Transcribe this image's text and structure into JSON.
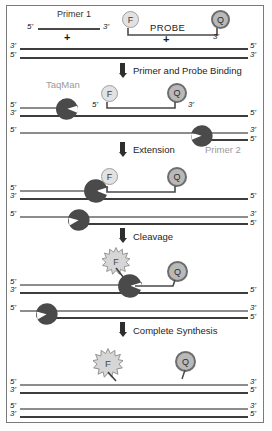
{
  "figure": {
    "colors": {
      "frame_border": "#7a7a7a",
      "strand_dark": "#3d3d3d",
      "strand_light": "#8d8d8d",
      "polymerase_fill": "#4a4a4a",
      "fluorophore_fill": "#e2e2e2",
      "quencher_fill": "#b9b9b9",
      "label_gray": "#9a9a9a",
      "arrow": "#2e2e2e"
    }
  },
  "reagents": {
    "primer1_label": "Primer 1",
    "primer1_five": "5'",
    "primer1_three": "3'",
    "plus1": "+",
    "plus2": "+",
    "probe_label": "PROBE",
    "probe_three": "3'",
    "fluorophore_letter": "F",
    "quencher_letter": "Q"
  },
  "steps": [
    {
      "id": "step-binding",
      "label": "Primer and Probe Binding"
    },
    {
      "id": "step-extension",
      "label": "Extension"
    },
    {
      "id": "step-cleavage",
      "label": "Cleavage"
    },
    {
      "id": "step-complete",
      "label": "Complete Synthesis"
    }
  ],
  "enzymes": {
    "taqman_label": "TaqMan",
    "primer2_label": "Primer 2"
  },
  "panels": {
    "template": {
      "name": "Double-stranded template DNA",
      "top_left": "3'",
      "top_right": "5'",
      "bottom_left": "5'",
      "bottom_right": "3'"
    },
    "binding": {
      "name": "Primer and probe annealed to template",
      "top_left": "5'",
      "template_left": "3'",
      "template_right": "5'",
      "lower_left": "5'",
      "lower_right_top": "3'",
      "lower_right_bottom": "5'",
      "probe_five": "5'",
      "probe_three": "3'"
    },
    "extension": {
      "name": "Polymerase extending the primer",
      "top_left": "5'",
      "template_left": "3'",
      "template_right": "5'",
      "lower_left": "5'",
      "lower_right_top": "3'",
      "lower_right_bottom": "5'"
    },
    "cleavage": {
      "name": "Probe cleaved, fluorophore released",
      "top_left": "5'",
      "template_left": "3'",
      "template_right": "5'",
      "lower_left": "5'",
      "lower_right_top": "3'",
      "lower_right_bottom": "5'"
    },
    "complete": {
      "name": "Two completed double-stranded products",
      "product1_top_left": "5'",
      "product1_top_right": "3'",
      "product1_bottom_left": "3'",
      "product1_bottom_right": "5'",
      "product2_top_left": "5'",
      "product2_top_right": "3'",
      "product2_bottom_left": "3'",
      "product2_bottom_right": "5'"
    }
  }
}
